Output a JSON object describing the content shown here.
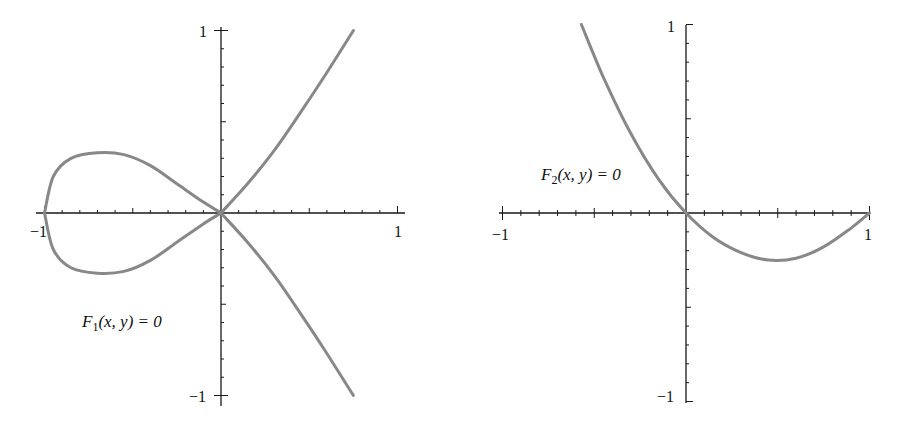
{
  "chart_data": [
    {
      "type": "line",
      "title": "",
      "annotation": "F1(x, y) = 0",
      "label_parts": {
        "fn": "F",
        "sub": "1",
        "args": "(x, y) = 0"
      },
      "xlabel": "",
      "ylabel": "",
      "xlim": [
        -1,
        1
      ],
      "ylim": [
        -1,
        1
      ],
      "x_ticks": [
        "-1",
        "1"
      ],
      "y_ticks": [
        "1",
        "-1"
      ],
      "minor_ticks_per_unit": 10,
      "grid": false,
      "curve_color": "#888888",
      "description": "Nodal cubic with a loop on x in [-1,0] and two branches through origin",
      "series": [
        {
          "name": "upper-loop",
          "points": [
            [
              -1,
              0
            ],
            [
              -0.95,
              0.2
            ],
            [
              -0.85,
              0.3
            ],
            [
              -0.7,
              0.33
            ],
            [
              -0.55,
              0.32
            ],
            [
              -0.4,
              0.26
            ],
            [
              -0.25,
              0.16
            ],
            [
              -0.1,
              0.06
            ],
            [
              0,
              0
            ]
          ]
        },
        {
          "name": "lower-loop",
          "points": [
            [
              -1,
              0
            ],
            [
              -0.95,
              -0.2
            ],
            [
              -0.85,
              -0.3
            ],
            [
              -0.7,
              -0.33
            ],
            [
              -0.55,
              -0.32
            ],
            [
              -0.4,
              -0.26
            ],
            [
              -0.25,
              -0.16
            ],
            [
              -0.1,
              -0.06
            ],
            [
              0,
              0
            ]
          ]
        },
        {
          "name": "upper-branch",
          "points": [
            [
              0,
              0
            ],
            [
              0.15,
              0.16
            ],
            [
              0.3,
              0.34
            ],
            [
              0.45,
              0.55
            ],
            [
              0.6,
              0.77
            ],
            [
              0.75,
              1.0
            ]
          ]
        },
        {
          "name": "lower-branch",
          "points": [
            [
              0,
              0
            ],
            [
              0.15,
              -0.16
            ],
            [
              0.3,
              -0.34
            ],
            [
              0.45,
              -0.55
            ],
            [
              0.6,
              -0.77
            ],
            [
              0.75,
              -1.0
            ]
          ]
        }
      ]
    },
    {
      "type": "line",
      "title": "",
      "annotation": "F2(x, y) = 0",
      "label_parts": {
        "fn": "F",
        "sub": "2",
        "args": "(x, y) = 0"
      },
      "xlabel": "",
      "ylabel": "",
      "xlim": [
        -1,
        1
      ],
      "ylim": [
        -1,
        1
      ],
      "x_ticks": [
        "-1",
        "1"
      ],
      "y_ticks": [
        "1",
        "-1"
      ],
      "minor_ticks_per_unit": 10,
      "grid": false,
      "curve_color": "#888888",
      "series": [
        {
          "name": "curve",
          "points": [
            [
              -0.57,
              1.0
            ],
            [
              -0.45,
              0.72
            ],
            [
              -0.3,
              0.42
            ],
            [
              -0.15,
              0.18
            ],
            [
              0,
              0
            ],
            [
              0.15,
              -0.13
            ],
            [
              0.3,
              -0.21
            ],
            [
              0.45,
              -0.25
            ],
            [
              0.6,
              -0.24
            ],
            [
              0.75,
              -0.18
            ],
            [
              0.9,
              -0.08
            ],
            [
              1.0,
              0
            ]
          ]
        }
      ]
    }
  ]
}
